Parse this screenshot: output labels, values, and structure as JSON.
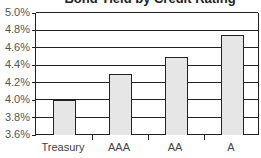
{
  "chart_data": {
    "type": "bar",
    "title": "Bond Yield by Credit Rating",
    "categories": [
      "Treasury",
      "AAA",
      "AA",
      "A"
    ],
    "values": [
      4.0,
      4.3,
      4.5,
      4.75
    ],
    "xlabel": "",
    "ylabel": "",
    "ylim": [
      3.6,
      5.0
    ],
    "yticks": [
      "5.0%",
      "4.8%",
      "4.6%",
      "4.4%",
      "4.2%",
      "4.0%",
      "3.8%",
      "3.6%"
    ],
    "grid": true,
    "legend": null,
    "bar_color": "#e6e6e6",
    "edge_color": "#222222"
  }
}
